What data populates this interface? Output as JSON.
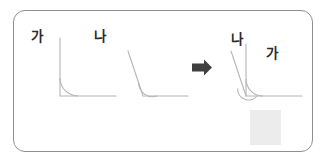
{
  "document": {
    "type": "math-worksheet-illustration",
    "title": "Angle comparison by superposition",
    "language": "ko"
  },
  "card": {
    "border_color": "#8d8f92",
    "background_color": "#ffffff",
    "corner_radius": "12px"
  },
  "labels": {
    "angle_a_first": "가",
    "angle_b_first": "나",
    "angle_b_overlay": "나",
    "angle_a_overlay": "가",
    "text_color": "#2b2b2b"
  },
  "figures": [
    {
      "name": "angle-ga",
      "label": "가",
      "description": "right angle, vertical ray and horizontal ray",
      "vertex": [
        60,
        96
      ],
      "rays": [
        {
          "name": "vertical-ray",
          "to": [
            60,
            38
          ]
        },
        {
          "name": "horizontal-ray",
          "to": [
            116,
            96
          ]
        }
      ],
      "arc_radius": 18,
      "measure_deg": 90,
      "stroke_color": "#b3b5b8"
    },
    {
      "name": "angle-na",
      "label": "나",
      "description": "obtuse angle, slanted ray up-left and horizontal ray",
      "vertex": [
        143,
        96
      ],
      "rays": [
        {
          "name": "slanted-ray",
          "to": [
            128,
            51
          ]
        },
        {
          "name": "horizontal-ray",
          "to": [
            188,
            96
          ]
        }
      ],
      "arc_radius": 14,
      "measure_deg": 109,
      "stroke_color": "#b3b5b8"
    },
    {
      "name": "angles-superimposed",
      "label": "가 + 나",
      "description": "angle ga and angle na overlaid on shared vertex and horizontal ray",
      "vertex": [
        246,
        96
      ],
      "rays": [
        {
          "name": "vertical-ray-ga",
          "to": [
            246,
            44
          ]
        },
        {
          "name": "slanted-ray-na",
          "to": [
            231,
            51
          ]
        },
        {
          "name": "horizontal-ray-shared",
          "to": [
            302,
            96
          ]
        }
      ],
      "arcs": [
        {
          "name": "arc-ga",
          "radius": 17
        },
        {
          "name": "arc-na",
          "radius": 11
        }
      ],
      "stroke_color": "#b3b5b8"
    }
  ],
  "arrow": {
    "name": "transform-arrow",
    "direction": "right",
    "color": "#3f3f3f",
    "position": [
      190,
      60
    ]
  },
  "decoration": {
    "gray_square": {
      "name": "gray-square",
      "color": "#ececec",
      "position": [
        250,
        110
      ],
      "size": [
        31,
        35
      ]
    }
  }
}
